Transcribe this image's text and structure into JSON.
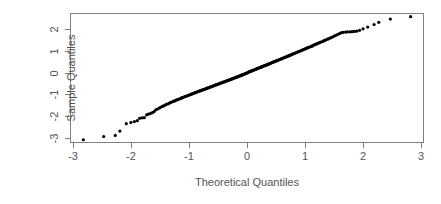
{
  "chart_data": {
    "type": "scatter",
    "title": "",
    "xlabel": "Theoretical Quantiles",
    "ylabel": "Sample Quantiles",
    "xlim": [
      -3.05,
      3.05
    ],
    "ylim": [
      -3.25,
      2.75
    ],
    "xticks": [
      "-3",
      "-2",
      "-1",
      "0",
      "1",
      "2",
      "3"
    ],
    "xtick_values": [
      -3,
      -2,
      -1,
      0,
      1,
      2,
      3
    ],
    "yticks": [
      "-3",
      "-2",
      "-1",
      "0",
      "1",
      "2"
    ],
    "ytick_values": [
      -3,
      -2,
      -1,
      0,
      1,
      2
    ],
    "grid": false,
    "legend": null,
    "point_color": "#000000",
    "point_size": 1.6,
    "frame_color": "#808080",
    "background": "#ffffff",
    "n_points": 243,
    "series": [
      {
        "name": "sample quantiles",
        "x": [
          -2.82,
          -2.47,
          -2.27,
          -2.19,
          -2.08,
          -2.0,
          -1.94,
          -1.89,
          -1.85,
          -1.81,
          -1.77,
          -1.73,
          -1.7,
          -1.66,
          -1.63,
          -1.6,
          -1.57,
          -1.54,
          -1.51,
          -1.49,
          -1.46,
          -1.44,
          -1.41,
          -1.39,
          -1.36,
          -1.34,
          -1.32,
          -1.3,
          -1.27,
          -1.25,
          -1.23,
          -1.21,
          -1.19,
          -1.17,
          -1.15,
          -1.13,
          -1.12,
          -1.1,
          -1.08,
          -1.06,
          -1.04,
          -1.02,
          -1.01,
          -0.99,
          -0.97,
          -0.95,
          -0.94,
          -0.92,
          -0.9,
          -0.89,
          -0.87,
          -0.86,
          -0.84,
          -0.82,
          -0.81,
          -0.79,
          -0.78,
          -0.76,
          -0.75,
          -0.73,
          -0.72,
          -0.7,
          -0.69,
          -0.67,
          -0.66,
          -0.64,
          -0.63,
          -0.61,
          -0.6,
          -0.59,
          -0.57,
          -0.56,
          -0.54,
          -0.53,
          -0.52,
          -0.5,
          -0.49,
          -0.47,
          -0.46,
          -0.45,
          -0.43,
          -0.42,
          -0.41,
          -0.39,
          -0.38,
          -0.37,
          -0.35,
          -0.34,
          -0.33,
          -0.31,
          -0.3,
          -0.29,
          -0.27,
          -0.26,
          -0.25,
          -0.24,
          -0.22,
          -0.21,
          -0.2,
          -0.18,
          -0.17,
          -0.16,
          -0.15,
          -0.13,
          -0.12,
          -0.11,
          -0.09,
          -0.08,
          -0.07,
          -0.06,
          -0.04,
          -0.03,
          -0.02,
          -0.01,
          0.01,
          0.02,
          0.03,
          0.04,
          0.06,
          0.07,
          0.08,
          0.09,
          0.11,
          0.12,
          0.13,
          0.15,
          0.16,
          0.17,
          0.18,
          0.2,
          0.21,
          0.22,
          0.24,
          0.25,
          0.26,
          0.27,
          0.29,
          0.3,
          0.31,
          0.33,
          0.34,
          0.35,
          0.37,
          0.38,
          0.39,
          0.41,
          0.42,
          0.43,
          0.45,
          0.46,
          0.47,
          0.49,
          0.5,
          0.52,
          0.53,
          0.54,
          0.56,
          0.57,
          0.59,
          0.6,
          0.61,
          0.63,
          0.64,
          0.66,
          0.67,
          0.69,
          0.7,
          0.72,
          0.73,
          0.75,
          0.76,
          0.78,
          0.79,
          0.81,
          0.82,
          0.84,
          0.86,
          0.87,
          0.89,
          0.9,
          0.92,
          0.94,
          0.95,
          0.97,
          0.99,
          1.01,
          1.02,
          1.04,
          1.06,
          1.08,
          1.1,
          1.12,
          1.13,
          1.15,
          1.17,
          1.19,
          1.21,
          1.23,
          1.25,
          1.27,
          1.3,
          1.32,
          1.34,
          1.36,
          1.39,
          1.41,
          1.44,
          1.46,
          1.49,
          1.51,
          1.54,
          1.57,
          1.6,
          1.63,
          1.66,
          1.7,
          1.73,
          1.77,
          1.81,
          1.85,
          1.89,
          1.94,
          2.0,
          2.08,
          2.19,
          2.27,
          2.47,
          2.82
        ],
        "y": [
          -3.1,
          -2.95,
          -2.9,
          -2.7,
          -2.36,
          -2.3,
          -2.26,
          -2.22,
          -2.11,
          -2.09,
          -2.08,
          -1.95,
          -1.92,
          -1.88,
          -1.85,
          -1.8,
          -1.72,
          -1.68,
          -1.64,
          -1.6,
          -1.56,
          -1.54,
          -1.5,
          -1.47,
          -1.44,
          -1.41,
          -1.38,
          -1.36,
          -1.33,
          -1.31,
          -1.28,
          -1.26,
          -1.24,
          -1.22,
          -1.2,
          -1.18,
          -1.16,
          -1.14,
          -1.12,
          -1.1,
          -1.08,
          -1.06,
          -1.05,
          -1.03,
          -1.01,
          -0.99,
          -0.97,
          -0.96,
          -0.94,
          -0.92,
          -0.91,
          -0.89,
          -0.87,
          -0.86,
          -0.84,
          -0.83,
          -0.81,
          -0.8,
          -0.78,
          -0.77,
          -0.75,
          -0.74,
          -0.72,
          -0.71,
          -0.69,
          -0.68,
          -0.66,
          -0.65,
          -0.63,
          -0.62,
          -0.61,
          -0.59,
          -0.58,
          -0.56,
          -0.55,
          -0.54,
          -0.52,
          -0.51,
          -0.49,
          -0.48,
          -0.47,
          -0.45,
          -0.44,
          -0.43,
          -0.41,
          -0.4,
          -0.39,
          -0.37,
          -0.36,
          -0.35,
          -0.33,
          -0.32,
          -0.31,
          -0.29,
          -0.28,
          -0.27,
          -0.25,
          -0.24,
          -0.23,
          -0.21,
          -0.2,
          -0.19,
          -0.17,
          -0.16,
          -0.15,
          -0.13,
          -0.12,
          -0.11,
          -0.09,
          -0.08,
          -0.07,
          -0.05,
          -0.04,
          -0.02,
          -0.01,
          0.01,
          0.02,
          0.04,
          0.05,
          0.07,
          0.08,
          0.09,
          0.11,
          0.12,
          0.13,
          0.15,
          0.16,
          0.18,
          0.19,
          0.2,
          0.22,
          0.23,
          0.25,
          0.26,
          0.27,
          0.29,
          0.3,
          0.32,
          0.33,
          0.34,
          0.36,
          0.37,
          0.39,
          0.4,
          0.42,
          0.43,
          0.45,
          0.46,
          0.48,
          0.49,
          0.51,
          0.52,
          0.54,
          0.55,
          0.57,
          0.58,
          0.6,
          0.61,
          0.63,
          0.64,
          0.66,
          0.68,
          0.69,
          0.71,
          0.72,
          0.74,
          0.76,
          0.77,
          0.79,
          0.81,
          0.82,
          0.84,
          0.86,
          0.88,
          0.89,
          0.91,
          0.93,
          0.95,
          0.97,
          0.98,
          1.0,
          1.02,
          1.04,
          1.06,
          1.08,
          1.1,
          1.12,
          1.14,
          1.16,
          1.18,
          1.2,
          1.22,
          1.24,
          1.27,
          1.29,
          1.31,
          1.34,
          1.36,
          1.38,
          1.41,
          1.43,
          1.46,
          1.49,
          1.51,
          1.54,
          1.57,
          1.6,
          1.63,
          1.66,
          1.7,
          1.73,
          1.77,
          1.81,
          1.84,
          1.86,
          1.87,
          1.88,
          1.88,
          1.89,
          1.9,
          1.91,
          1.95,
          2.02,
          2.1,
          2.22,
          2.32,
          2.47,
          2.58
        ]
      }
    ]
  }
}
